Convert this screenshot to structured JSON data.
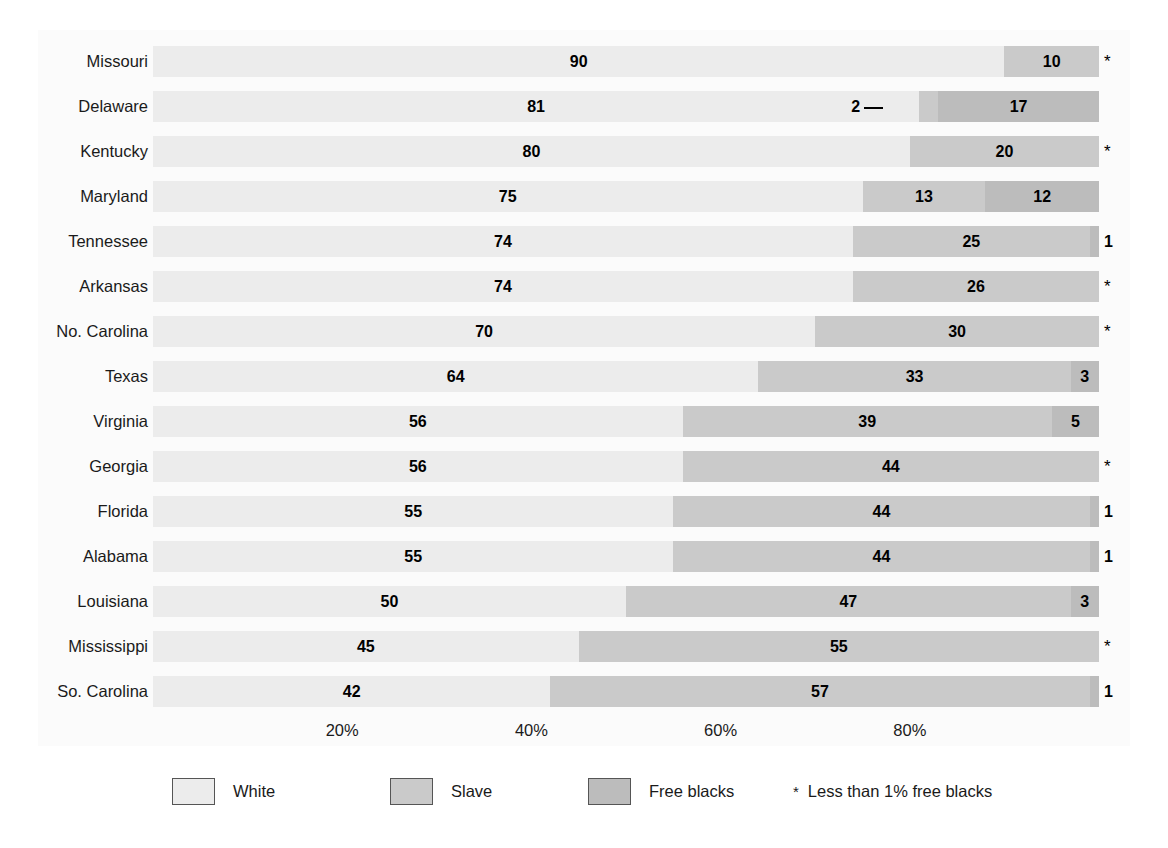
{
  "chart_data": {
    "type": "bar",
    "subtype": "horizontal-stacked-100pct",
    "title": "",
    "xlabel": "",
    "ylabel": "",
    "xlim": [
      0,
      100
    ],
    "grid": false,
    "legend_position": "bottom",
    "categories": [
      "Missouri",
      "Delaware",
      "Kentucky",
      "Maryland",
      "Tennessee",
      "Arkansas",
      "No. Carolina",
      "Texas",
      "Virginia",
      "Georgia",
      "Florida",
      "Alabama",
      "Louisiana",
      "Mississippi",
      "So. Carolina"
    ],
    "series": [
      {
        "name": "White",
        "color": "#ececec",
        "values": [
          90,
          81,
          80,
          75,
          74,
          74,
          70,
          64,
          56,
          56,
          55,
          55,
          50,
          45,
          42
        ]
      },
      {
        "name": "Slave",
        "color": "#cacaca",
        "values": [
          10,
          2,
          20,
          13,
          25,
          26,
          30,
          33,
          39,
          44,
          44,
          44,
          47,
          55,
          57
        ]
      },
      {
        "name": "Free blacks",
        "color": "#bcbcbc",
        "values": [
          0,
          17,
          0,
          12,
          1,
          0,
          0,
          3,
          5,
          0,
          1,
          1,
          3,
          0,
          1
        ]
      }
    ],
    "xticks": [
      20,
      40,
      60,
      80
    ],
    "xtick_labels": [
      "20%",
      "40%",
      "60%",
      "80%"
    ],
    "star_symbol": "*",
    "star_meaning": "Less than 1% free blacks",
    "rows": [
      {
        "label": "Missouri",
        "white": 90,
        "slave": 10,
        "free": 0,
        "white_label": "90",
        "slave_label": "10",
        "free_label": "*",
        "free_outside": true,
        "free_is_star": true,
        "slave_leader": false
      },
      {
        "label": "Delaware",
        "white": 81,
        "slave": 2,
        "free": 17,
        "white_label": "81",
        "slave_label": "2",
        "free_label": "17",
        "free_outside": false,
        "free_is_star": false,
        "slave_leader": true
      },
      {
        "label": "Kentucky",
        "white": 80,
        "slave": 20,
        "free": 0,
        "white_label": "80",
        "slave_label": "20",
        "free_label": "*",
        "free_outside": true,
        "free_is_star": true,
        "slave_leader": false
      },
      {
        "label": "Maryland",
        "white": 75,
        "slave": 13,
        "free": 12,
        "white_label": "75",
        "slave_label": "13",
        "free_label": "12",
        "free_outside": false,
        "free_is_star": false,
        "slave_leader": false
      },
      {
        "label": "Tennessee",
        "white": 74,
        "slave": 25,
        "free": 1,
        "white_label": "74",
        "slave_label": "25",
        "free_label": "1",
        "free_outside": true,
        "free_is_star": false,
        "slave_leader": false
      },
      {
        "label": "Arkansas",
        "white": 74,
        "slave": 26,
        "free": 0,
        "white_label": "74",
        "slave_label": "26",
        "free_label": "*",
        "free_outside": true,
        "free_is_star": true,
        "slave_leader": false
      },
      {
        "label": "No. Carolina",
        "white": 70,
        "slave": 30,
        "free": 0,
        "white_label": "70",
        "slave_label": "30",
        "free_label": "*",
        "free_outside": true,
        "free_is_star": true,
        "slave_leader": false
      },
      {
        "label": "Texas",
        "white": 64,
        "slave": 33,
        "free": 3,
        "white_label": "64",
        "slave_label": "33",
        "free_label": "3",
        "free_outside": false,
        "free_is_star": false,
        "slave_leader": false
      },
      {
        "label": "Virginia",
        "white": 56,
        "slave": 39,
        "free": 5,
        "white_label": "56",
        "slave_label": "39",
        "free_label": "5",
        "free_outside": false,
        "free_is_star": false,
        "slave_leader": false
      },
      {
        "label": "Georgia",
        "white": 56,
        "slave": 44,
        "free": 0,
        "white_label": "56",
        "slave_label": "44",
        "free_label": "*",
        "free_outside": true,
        "free_is_star": true,
        "slave_leader": false
      },
      {
        "label": "Florida",
        "white": 55,
        "slave": 44,
        "free": 1,
        "white_label": "55",
        "slave_label": "44",
        "free_label": "1",
        "free_outside": true,
        "free_is_star": false,
        "slave_leader": false
      },
      {
        "label": "Alabama",
        "white": 55,
        "slave": 44,
        "free": 1,
        "white_label": "55",
        "slave_label": "44",
        "free_label": "1",
        "free_outside": true,
        "free_is_star": false,
        "slave_leader": false
      },
      {
        "label": "Louisiana",
        "white": 50,
        "slave": 47,
        "free": 3,
        "white_label": "50",
        "slave_label": "47",
        "free_label": "3",
        "free_outside": false,
        "free_is_star": false,
        "slave_leader": false
      },
      {
        "label": "Mississippi",
        "white": 45,
        "slave": 55,
        "free": 0,
        "white_label": "45",
        "slave_label": "55",
        "free_label": "*",
        "free_outside": true,
        "free_is_star": true,
        "slave_leader": false
      },
      {
        "label": "So. Carolina",
        "white": 42,
        "slave": 57,
        "free": 1,
        "white_label": "42",
        "slave_label": "57",
        "free_label": "1",
        "free_outside": true,
        "free_is_star": false,
        "slave_leader": false
      }
    ]
  },
  "legend": {
    "items": [
      {
        "label": "White",
        "color": "#ececec"
      },
      {
        "label": "Slave",
        "color": "#cacaca"
      },
      {
        "label": "Free blacks",
        "color": "#bcbcbc"
      }
    ],
    "note_symbol": "*",
    "note_text": "Less than 1% free blacks"
  }
}
